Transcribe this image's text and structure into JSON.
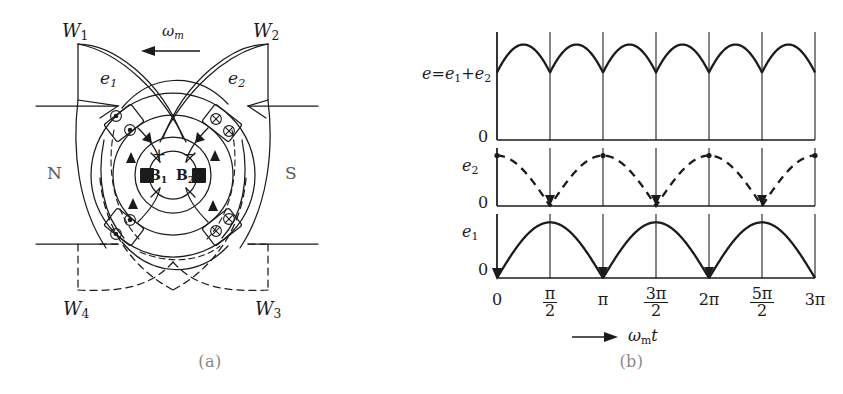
{
  "figure": {
    "panels": [
      {
        "id": "a",
        "caption": "(a)",
        "description": "two-coil DC machine cross-section"
      },
      {
        "id": "b",
        "caption": "(b)",
        "description": "emf waveforms"
      }
    ]
  },
  "machine": {
    "windings": [
      {
        "name": "W1",
        "base": "W",
        "sub": "1",
        "position": "top-left"
      },
      {
        "name": "W2",
        "base": "W",
        "sub": "2",
        "position": "top-right"
      },
      {
        "name": "W3",
        "base": "W",
        "sub": "3",
        "position": "bottom-right"
      },
      {
        "name": "W4",
        "base": "W",
        "sub": "4",
        "position": "bottom-left"
      }
    ],
    "emf_labels": [
      {
        "name": "e1",
        "base": "e",
        "sub": "1",
        "position": "upper-left"
      },
      {
        "name": "e2",
        "base": "e",
        "sub": "2",
        "position": "upper-right"
      }
    ],
    "poles": [
      {
        "label": "N",
        "position": "left"
      },
      {
        "label": "S",
        "position": "right"
      }
    ],
    "brushes": [
      {
        "base": "B",
        "sub": "1",
        "polarity": "+"
      },
      {
        "base": "B",
        "sub": "2",
        "polarity": "−"
      }
    ],
    "polarity_plus": "+",
    "polarity_minus": "−",
    "rotation": {
      "base": "ω",
      "sub": "m",
      "arrow": "left"
    },
    "conductor_marks": {
      "out_of_page": "dot",
      "into_page": "cross"
    }
  },
  "chart_data": {
    "type": "line",
    "title": "",
    "xlabel_base": "ω",
    "xlabel_sub": "m",
    "xlabel_tail": "t",
    "xlabel_arrow": "→",
    "xlim": [
      0,
      9.42477796
    ],
    "x_tick_values": [
      0,
      1.5707963,
      3.1415927,
      4.712389,
      6.2831853,
      7.8539816,
      9.424778
    ],
    "x_tick_labels": [
      {
        "kind": "plain",
        "text": "0"
      },
      {
        "kind": "frac",
        "num": "π",
        "den": "2"
      },
      {
        "kind": "plain",
        "text": "π"
      },
      {
        "kind": "frac",
        "num": "3π",
        "den": "2"
      },
      {
        "kind": "plain",
        "text": "2π"
      },
      {
        "kind": "frac",
        "num": "5π",
        "den": "2"
      },
      {
        "kind": "plain",
        "text": "3π"
      }
    ],
    "grid": {
      "vertical": true,
      "horizontal": false
    },
    "legend": {
      "position": "left-of-axes"
    },
    "series": [
      {
        "name": "e = e1 + e2",
        "label_base": "e",
        "label_equals": "=",
        "label_term1_base": "e",
        "label_term1_sub": "1",
        "label_plus": "+",
        "label_term2_base": "e",
        "label_term2_sub": "2",
        "style": "solid",
        "row": "top",
        "baseline_label": "0",
        "formula": "abs(sin(x)) + abs(cos(x))",
        "peak_value": 1.41421356,
        "min_value": 1.0,
        "ylim": [
          0,
          1.6
        ]
      },
      {
        "name": "e2",
        "label_base": "e",
        "label_sub": "2",
        "style": "dashed",
        "row": "middle",
        "baseline_label": "0",
        "formula": "abs(cos(x))",
        "peak_value": 1.0,
        "zeros_at": [
          1.5707963,
          4.712389,
          7.8539816
        ],
        "peaks_at": [
          0,
          3.1415927,
          6.2831853,
          9.424778
        ],
        "ylim": [
          0,
          1.15
        ]
      },
      {
        "name": "e1",
        "label_base": "e",
        "label_sub": "1",
        "style": "solid",
        "row": "bottom",
        "baseline_label": "0",
        "formula": "abs(sin(x))",
        "peak_value": 1.0,
        "zeros_at": [
          0,
          3.1415927,
          6.2831853,
          9.424778
        ],
        "peaks_at": [
          1.5707963,
          4.712389,
          7.8539816
        ],
        "ylim": [
          0,
          1.15
        ]
      }
    ]
  },
  "colors": {
    "ink": "#1b1b1b",
    "grid": "#2a2a2a",
    "muted": "#5b5b5b",
    "caption": "#8a8a8a",
    "background": "#ffffff"
  }
}
